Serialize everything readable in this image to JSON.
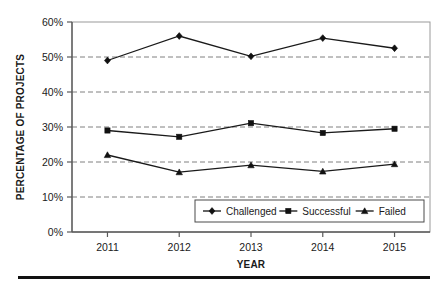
{
  "chart_data": {
    "type": "line",
    "title": "",
    "subtitle": "",
    "xlabel": "YEAR",
    "ylabel": "PERCENTAGE OF PROJECTS",
    "categories": [
      "2011",
      "2012",
      "2013",
      "2014",
      "2015"
    ],
    "x": [
      2011,
      2012,
      2013,
      2014,
      2015
    ],
    "ylim": [
      0,
      60
    ],
    "yticks": [
      0,
      10,
      20,
      30,
      40,
      50,
      60
    ],
    "ytick_labels": [
      "0%",
      "10%",
      "20%",
      "30%",
      "40%",
      "50%",
      "60%"
    ],
    "grid": "horizontal-dashed",
    "legend_position": "inside-lower-right",
    "series": [
      {
        "name": "Challenged",
        "marker": "diamond",
        "color": "#111111",
        "values": [
          49.0,
          56.0,
          50.2,
          55.4,
          52.5
        ]
      },
      {
        "name": "Successful",
        "marker": "square",
        "color": "#111111",
        "values": [
          29.0,
          27.2,
          31.1,
          28.3,
          29.5
        ]
      },
      {
        "name": "Failed",
        "marker": "triangle",
        "color": "#111111",
        "values": [
          22.0,
          17.1,
          19.1,
          17.3,
          19.4
        ]
      }
    ]
  },
  "axis": {
    "y_title": "PERCENTAGE OF PROJECTS",
    "x_title": "YEAR",
    "y_ticks": [
      "60%",
      "50%",
      "40%",
      "30%",
      "20%",
      "10%",
      "0%"
    ],
    "x_ticks": [
      "2011",
      "2012",
      "2013",
      "2014",
      "2015"
    ]
  },
  "legend": {
    "items": [
      {
        "label": "Challenged",
        "marker": "diamond-marker-icon"
      },
      {
        "label": "Successful",
        "marker": "square-marker-icon"
      },
      {
        "label": "Failed",
        "marker": "triangle-marker-icon"
      }
    ]
  }
}
